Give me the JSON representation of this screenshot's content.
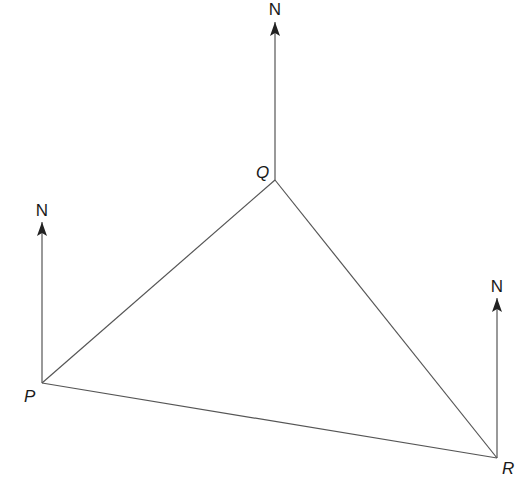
{
  "diagram": {
    "points": {
      "P": {
        "label": "P",
        "x": 42,
        "y": 383
      },
      "Q": {
        "label": "Q",
        "x": 275,
        "y": 180
      },
      "R": {
        "label": "R",
        "x": 497,
        "y": 458
      }
    },
    "north_label": "N",
    "north_arrows": [
      {
        "at": "Q",
        "top_y": 22
      },
      {
        "at": "P",
        "top_y": 222
      },
      {
        "at": "R",
        "top_y": 298
      }
    ],
    "line_color": "#555555"
  }
}
